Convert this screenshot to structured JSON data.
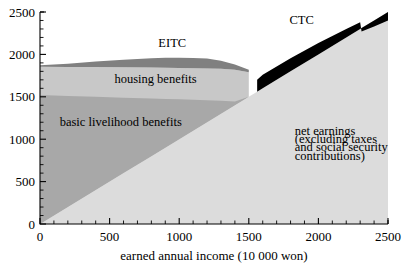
{
  "chart_data": {
    "type": "area",
    "title": "",
    "xlabel": "earned annual income (10 000 won)",
    "ylabel": "",
    "xlim": [
      0,
      2500
    ],
    "ylim": [
      0,
      2500
    ],
    "grid": false,
    "legend_position": "inline-annotations",
    "x_ticks": [
      "0",
      "500",
      "1000",
      "1500",
      "2000",
      "2500"
    ],
    "y_ticks": [
      "0",
      "500",
      "1000",
      "1500",
      "2000",
      "2500"
    ],
    "x_tick_values": [
      0,
      500,
      1000,
      1500,
      2000,
      2500
    ],
    "y_tick_values": [
      0,
      500,
      1000,
      1500,
      2000,
      2500
    ],
    "x_minor_step": 100,
    "y_minor_step": 100,
    "stacking": "stacked",
    "x": [
      0,
      200,
      400,
      600,
      800,
      900,
      1000,
      1100,
      1200,
      1300,
      1400,
      1500,
      1560,
      1600,
      1800,
      2000,
      2200,
      2300,
      2310,
      2400,
      2500
    ],
    "series": [
      {
        "name": "net earnings (excluding taxes and social security contributions)",
        "color": "#dcdcdc",
        "values": [
          0,
          200,
          400,
          600,
          800,
          900,
          1000,
          1100,
          1200,
          1300,
          1400,
          1500,
          1560,
          1600,
          1800,
          2000,
          2200,
          2300,
          2310,
          2400,
          2500
        ],
        "label": "net earnings\n(excluding taxes\nand social security\ncontributions)"
      },
      {
        "name": "basic livelihood benefits",
        "color": "#a8a8a8",
        "cumulative_top": [
          1520,
          1510,
          1500,
          1490,
          1480,
          1475,
          1470,
          1465,
          1458,
          1452,
          1446,
          1500,
          null,
          null,
          null,
          null,
          null,
          null,
          null,
          null,
          null
        ],
        "label": "basic livelihood benefits"
      },
      {
        "name": "housing benefits",
        "color": "#c8c8c8",
        "cumulative_top": [
          1855,
          1852,
          1850,
          1848,
          1845,
          1843,
          1840,
          1838,
          1835,
          1830,
          1820,
          1790,
          1560,
          1600,
          1800,
          2000,
          2200,
          2300,
          2310,
          2400,
          2500
        ],
        "label": "housing benefits"
      },
      {
        "name": "EITC",
        "color": "#808080",
        "cumulative_top": [
          1872,
          1890,
          1915,
          1938,
          1955,
          1960,
          1960,
          1958,
          1952,
          1925,
          1880,
          1820,
          null,
          null,
          null,
          null,
          null,
          null,
          null,
          null,
          null
        ],
        "label": "EITC"
      },
      {
        "name": "CTC",
        "color": "#000000",
        "start_x": 1560,
        "cumulative_top": [
          null,
          null,
          null,
          null,
          null,
          null,
          null,
          null,
          null,
          null,
          null,
          null,
          1700,
          1760,
          1955,
          2135,
          2300,
          2380,
          2270,
          2330,
          2400
        ],
        "label": "CTC"
      }
    ],
    "annotations": [
      {
        "text": "EITC",
        "x": 950,
        "y": 2090
      },
      {
        "text": "CTC",
        "x": 1880,
        "y": 2360
      },
      {
        "text": "housing benefits",
        "x": 830,
        "y": 1660
      },
      {
        "text": "basic livelihood benefits",
        "x": 580,
        "y": 1160
      },
      {
        "text": "net earnings",
        "x": 1830,
        "y": 1050
      },
      {
        "text": "(excluding taxes",
        "x": 1830,
        "y": 950
      },
      {
        "text": "and social security",
        "x": 1830,
        "y": 855
      },
      {
        "text": "contributions)",
        "x": 1830,
        "y": 760
      }
    ]
  }
}
